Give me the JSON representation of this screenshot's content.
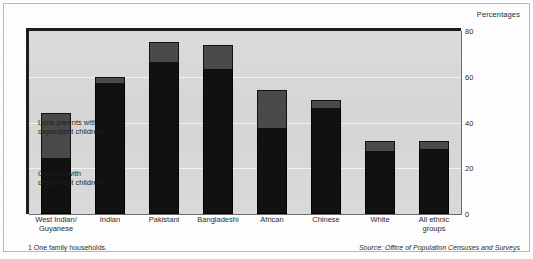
{
  "caption": {
    "percentages_label": "Percentages",
    "footnote": "1  One family households.",
    "source": "Source: Office of Population Censuses and Surveys"
  },
  "legend": {
    "lone_parents": "Lone parents with\ndependent children",
    "couples": "Couples with\ndependent children"
  },
  "colors": {
    "lone_parents": "#4a4a4a",
    "couples": "#111111",
    "plot_background": "#d9d9d9",
    "gridline": "#f3f3f3",
    "frame": "#1d1d1d"
  },
  "chart_data": {
    "type": "bar",
    "title": "",
    "subtitle": "",
    "xlabel": "",
    "ylabel": "Percentages",
    "ylim": [
      0,
      80
    ],
    "yticks": [
      "0",
      "20",
      "40",
      "60",
      "80"
    ],
    "grid": true,
    "stacked": true,
    "legend_position": "inside-left",
    "categories": [
      "West Indian/\nGuyanese",
      "Indian",
      "Pakistani",
      "Bangladeshi",
      "African",
      "Chinese",
      "White",
      "All ethnic\ngroups"
    ],
    "series": [
      {
        "name": "Couples with dependent children",
        "values": [
          24,
          57,
          66,
          63,
          37,
          46,
          27,
          28
        ]
      },
      {
        "name": "Lone parents with dependent children",
        "values": [
          20,
          3,
          9,
          11,
          17,
          4,
          5,
          4
        ]
      }
    ],
    "totals": [
      44,
      60,
      75,
      74,
      54,
      50,
      32,
      32
    ],
    "annotations": [
      "1  One family households.",
      "Source: Office of Population Censuses and Surveys"
    ]
  }
}
